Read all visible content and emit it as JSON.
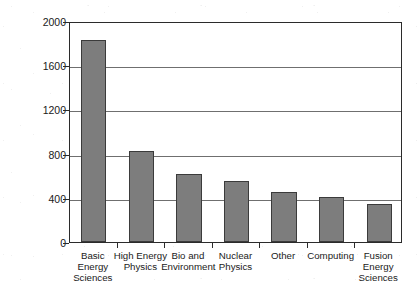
{
  "chart_data": {
    "type": "bar",
    "title": "",
    "subtitle": "",
    "xlabel": "",
    "ylabel": "U.S. $ (millions)",
    "categories": [
      "Basic\nEnergy\nSciences",
      "High Energy\nPhysics",
      "Bio and\nEnvironment",
      "Nuclear\nPhysics",
      "Other",
      "Computing",
      "Fusion\nEnergy\nSciences"
    ],
    "values": [
      1830,
      825,
      615,
      550,
      450,
      405,
      345
    ],
    "ylim": [
      0,
      2000
    ],
    "yticks": [
      0,
      400,
      800,
      1200,
      1600,
      2000
    ],
    "ytick_labels": [
      "0",
      "400",
      "800",
      "1200",
      "1600",
      "2000"
    ],
    "minor_ticks_per_interval": 3,
    "grid": "horizontal",
    "legend": "none",
    "bar_color": "#7d7d7d",
    "bar_edge_color": "#3b3b3b",
    "axis_color": "#2b2b2b",
    "gridline_color": "#6f6f6f",
    "background_color": "#ffffff"
  }
}
